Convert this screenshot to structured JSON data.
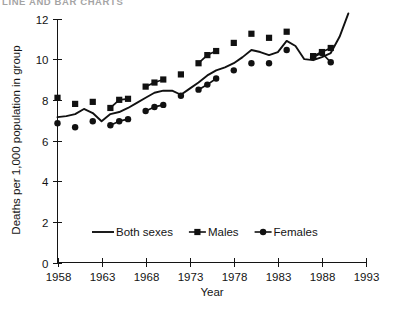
{
  "page": {
    "clipped_header_text": "LINE AND BAR CHARTS"
  },
  "chart_data": {
    "type": "line",
    "title": "",
    "subtitle": "",
    "xlabel": "Year",
    "ylabel": "Deaths per 1,000 population in group",
    "xlim": [
      1958,
      1993
    ],
    "ylim": [
      0,
      12
    ],
    "x_ticks": [
      1958,
      1963,
      1968,
      1973,
      1978,
      1983,
      1988,
      1993
    ],
    "x_tick_labels": [
      "1958",
      "1963",
      "1968",
      "1973",
      "1978",
      "1983",
      "1988",
      "1993"
    ],
    "y_ticks": [
      0,
      2,
      4,
      6,
      8,
      10,
      12
    ],
    "y_tick_labels": [
      "0",
      "2",
      "4",
      "6",
      "8",
      "10",
      "12"
    ],
    "grid": false,
    "legend_position": "inside-lower-center",
    "legend": [
      {
        "name": "Both sexes",
        "marker": "none",
        "style": "line"
      },
      {
        "name": "Males",
        "marker": "square",
        "style": "line-marker"
      },
      {
        "name": "Females",
        "marker": "circle",
        "style": "line-marker"
      }
    ],
    "series": [
      {
        "name": "Both sexes",
        "marker": "none",
        "x": [
          1958,
          1959,
          1960,
          1961,
          1962,
          1963,
          1964,
          1965,
          1966,
          1967,
          1968,
          1969,
          1970,
          1971,
          1972,
          1973,
          1974,
          1975,
          1976,
          1977,
          1978,
          1979,
          1980,
          1981,
          1982,
          1983,
          1984,
          1985,
          1986,
          1987,
          1988,
          1989,
          1990,
          1991
        ],
        "values": [
          7.15,
          7.2,
          7.3,
          7.55,
          7.35,
          6.95,
          7.3,
          7.4,
          7.6,
          7.85,
          8.1,
          8.35,
          8.45,
          8.45,
          8.25,
          8.55,
          8.85,
          9.2,
          9.45,
          9.6,
          9.8,
          10.1,
          10.45,
          10.35,
          10.2,
          10.35,
          10.9,
          10.65,
          10.0,
          9.95,
          10.1,
          10.3,
          11.1,
          12.25
        ]
      },
      {
        "name": "Males",
        "marker": "square",
        "x": [
          1958,
          1960,
          1962,
          1964,
          1965,
          1966,
          1968,
          1969,
          1970,
          1972,
          1974,
          1975,
          1976,
          1978,
          1980,
          1982,
          1984,
          1987,
          1988,
          1989
        ],
        "values": [
          8.1,
          7.8,
          7.9,
          7.6,
          8.0,
          8.05,
          8.65,
          8.85,
          9.0,
          9.25,
          9.8,
          10.2,
          10.4,
          10.8,
          11.25,
          11.05,
          11.35,
          10.15,
          10.35,
          10.55
        ]
      },
      {
        "name": "Females",
        "marker": "circle",
        "x": [
          1958,
          1960,
          1962,
          1964,
          1965,
          1966,
          1968,
          1969,
          1970,
          1972,
          1974,
          1975,
          1976,
          1978,
          1980,
          1982,
          1984,
          1987,
          1988,
          1989
        ],
        "values": [
          6.85,
          6.65,
          6.95,
          6.75,
          6.95,
          7.05,
          7.45,
          7.65,
          7.75,
          8.2,
          8.5,
          8.75,
          9.05,
          9.45,
          9.8,
          9.8,
          10.45,
          10.1,
          10.3,
          9.85
        ]
      }
    ],
    "colors": {
      "ink": "#111111",
      "axis": "#141414",
      "background": "#ffffff"
    }
  }
}
